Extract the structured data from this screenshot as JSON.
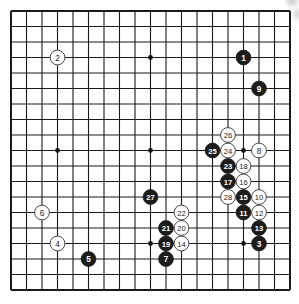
{
  "diagram": {
    "type": "go-board",
    "size": 19,
    "origin": {
      "x": 11,
      "y": 11
    },
    "spacing": 15.5,
    "colors": {
      "background": "#ffffff",
      "line": "#1a1a1a",
      "black_stone": "#1c1c1c",
      "black_text": "#ffffff",
      "white_stone": "#ffffff",
      "white_text": "#222222",
      "star": "#111111"
    },
    "star_points": [
      [
        3,
        3
      ],
      [
        9,
        3
      ],
      [
        15,
        3
      ],
      [
        3,
        9
      ],
      [
        9,
        9
      ],
      [
        15,
        9
      ],
      [
        3,
        15
      ],
      [
        9,
        15
      ],
      [
        15,
        15
      ]
    ],
    "stones": [
      {
        "n": "1",
        "color": "black",
        "col": 15,
        "row": 3
      },
      {
        "n": "2",
        "color": "white",
        "col": 3,
        "row": 3
      },
      {
        "n": "3",
        "color": "black",
        "col": 16,
        "row": 15
      },
      {
        "n": "4",
        "color": "white",
        "col": 3,
        "row": 15
      },
      {
        "n": "5",
        "color": "black",
        "col": 5,
        "row": 16
      },
      {
        "n": "6",
        "color": "white",
        "col": 2,
        "row": 13
      },
      {
        "n": "7",
        "color": "black",
        "col": 10,
        "row": 16
      },
      {
        "n": "8",
        "color": "white",
        "col": 16,
        "row": 9
      },
      {
        "n": "9",
        "color": "black",
        "col": 16,
        "row": 5
      },
      {
        "n": "10",
        "color": "white",
        "col": 16,
        "row": 12
      },
      {
        "n": "11",
        "color": "black",
        "col": 15,
        "row": 13
      },
      {
        "n": "12",
        "color": "white",
        "col": 16,
        "row": 13
      },
      {
        "n": "13",
        "color": "black",
        "col": 16,
        "row": 14
      },
      {
        "n": "14",
        "color": "white",
        "col": 11,
        "row": 15
      },
      {
        "n": "15",
        "color": "black",
        "col": 15,
        "row": 12
      },
      {
        "n": "16",
        "color": "white",
        "col": 15,
        "row": 11
      },
      {
        "n": "17",
        "color": "black",
        "col": 14,
        "row": 11
      },
      {
        "n": "18",
        "color": "white",
        "col": 15,
        "row": 10
      },
      {
        "n": "19",
        "color": "black",
        "col": 10,
        "row": 15
      },
      {
        "n": "20",
        "color": "white",
        "col": 11,
        "row": 14
      },
      {
        "n": "21",
        "color": "black",
        "col": 10,
        "row": 14
      },
      {
        "n": "22",
        "color": "white",
        "col": 11,
        "row": 13
      },
      {
        "n": "23",
        "color": "black",
        "col": 14,
        "row": 10
      },
      {
        "n": "24",
        "color": "white",
        "col": 14,
        "row": 9
      },
      {
        "n": "25",
        "color": "black",
        "col": 13,
        "row": 9
      },
      {
        "n": "26",
        "color": "white",
        "col": 14,
        "row": 8
      },
      {
        "n": "27",
        "color": "black",
        "col": 9,
        "row": 12
      },
      {
        "n": "28",
        "color": "white",
        "col": 14,
        "row": 12
      }
    ]
  }
}
